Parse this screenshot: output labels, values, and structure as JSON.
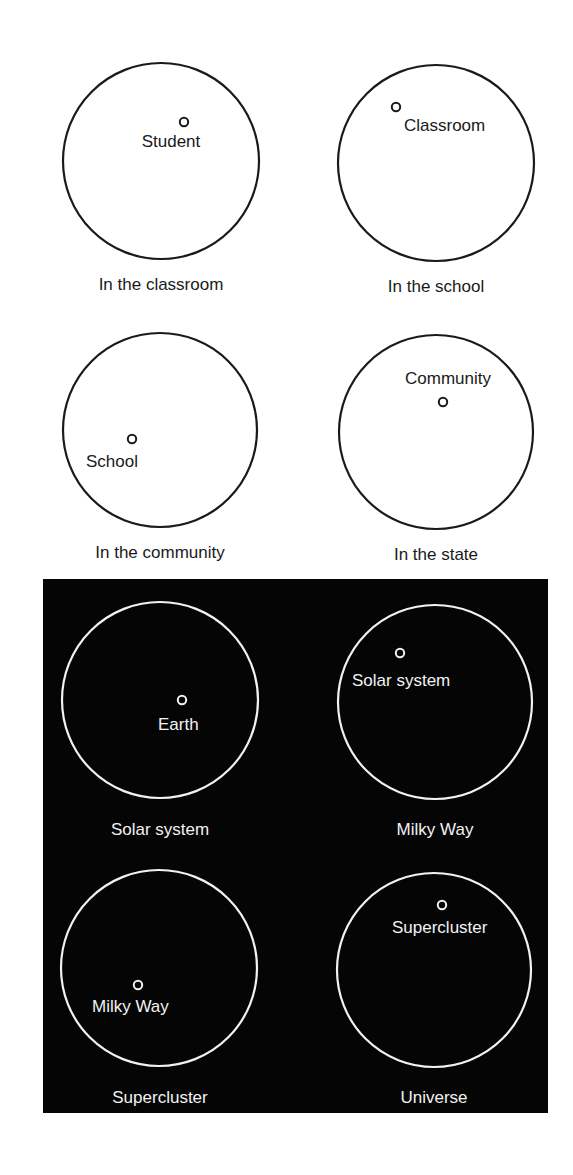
{
  "figure": {
    "colors": {
      "background": "#ffffff",
      "ink": "#1a1a1a",
      "dark_panel": "#050505",
      "light_ink": "#f2f2f2"
    },
    "dark_panel": {
      "x": 43,
      "y": 579,
      "width": 505,
      "height": 534
    },
    "panels": [
      {
        "id": "classroom",
        "theme": "light",
        "cx": 161,
        "cy": 161,
        "r": 98,
        "dot": {
          "x": 184,
          "y": 122
        },
        "dot_label": "Student",
        "dot_label_pos": {
          "x": 171,
          "y": 147,
          "anchor": "middle"
        },
        "caption": "In the classroom",
        "caption_pos": {
          "x": 161,
          "y": 290
        }
      },
      {
        "id": "school",
        "theme": "light",
        "cx": 436,
        "cy": 163,
        "r": 98,
        "dot": {
          "x": 396,
          "y": 107
        },
        "dot_label": "Classroom",
        "dot_label_pos": {
          "x": 404,
          "y": 131,
          "anchor": "start"
        },
        "caption": "In the school",
        "caption_pos": {
          "x": 436,
          "y": 292
        }
      },
      {
        "id": "community",
        "theme": "light",
        "cx": 160,
        "cy": 430,
        "r": 97,
        "dot": {
          "x": 132,
          "y": 439
        },
        "dot_label": "School",
        "dot_label_pos": {
          "x": 86,
          "y": 467,
          "anchor": "start"
        },
        "caption": "In the community",
        "caption_pos": {
          "x": 160,
          "y": 558
        }
      },
      {
        "id": "state",
        "theme": "light",
        "cx": 436,
        "cy": 432,
        "r": 97,
        "dot": {
          "x": 443,
          "y": 402
        },
        "dot_label": "Community",
        "dot_label_pos": {
          "x": 405,
          "y": 384,
          "anchor": "start"
        },
        "caption": "In the state",
        "caption_pos": {
          "x": 436,
          "y": 560
        }
      },
      {
        "id": "solar-system",
        "theme": "dark",
        "cx": 160,
        "cy": 700,
        "r": 98,
        "dot": {
          "x": 182,
          "y": 700
        },
        "dot_label": "Earth",
        "dot_label_pos": {
          "x": 158,
          "y": 730,
          "anchor": "start"
        },
        "caption": "Solar system",
        "caption_pos": {
          "x": 160,
          "y": 835
        }
      },
      {
        "id": "milky-way",
        "theme": "dark",
        "cx": 435,
        "cy": 702,
        "r": 97,
        "dot": {
          "x": 400,
          "y": 653
        },
        "dot_label": "Solar system",
        "dot_label_pos": {
          "x": 352,
          "y": 686,
          "anchor": "start"
        },
        "caption": "Milky Way",
        "caption_pos": {
          "x": 435,
          "y": 835
        }
      },
      {
        "id": "supercluster",
        "theme": "dark",
        "cx": 159,
        "cy": 968,
        "r": 98,
        "dot": {
          "x": 138,
          "y": 985
        },
        "dot_label": "Milky Way",
        "dot_label_pos": {
          "x": 92,
          "y": 1012,
          "anchor": "start"
        },
        "caption": "Supercluster",
        "caption_pos": {
          "x": 160,
          "y": 1103
        }
      },
      {
        "id": "universe",
        "theme": "dark",
        "cx": 434,
        "cy": 970,
        "r": 97,
        "dot": {
          "x": 442,
          "y": 905
        },
        "dot_label": "Supercluster",
        "dot_label_pos": {
          "x": 392,
          "y": 933,
          "anchor": "start"
        },
        "caption": "Universe",
        "caption_pos": {
          "x": 434,
          "y": 1103
        }
      }
    ]
  }
}
